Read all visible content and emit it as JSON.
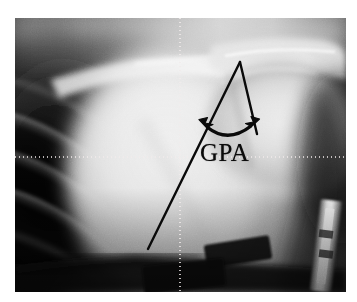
{
  "figure": {
    "kind": "radiograph",
    "modality": "shoulder-ap-xray",
    "background_color": "#ffffff"
  },
  "xray": {
    "name": "shoulder-radiograph",
    "frame": {
      "x": 15,
      "y": 18,
      "width": 331,
      "height": 274
    },
    "tone": {
      "darkest": "#050505",
      "dark": "#242424",
      "mid": "#8a8a8a",
      "light": "#d2d2d2",
      "brightest": "#fbfbfb"
    },
    "anatomy": [
      {
        "name": "clavicle",
        "label": "Clavicle"
      },
      {
        "name": "acromion",
        "label": "Acromion"
      },
      {
        "name": "humeral-head",
        "label": "Humeral head"
      },
      {
        "name": "glenoid",
        "label": "Glenoid"
      },
      {
        "name": "scapula-body",
        "label": "Scapula"
      },
      {
        "name": "rib-cage",
        "label": "Ribs"
      },
      {
        "name": "lung-field",
        "label": "Lung field"
      }
    ],
    "hardware": [
      {
        "name": "ecg-lead-left",
        "label": "ECG lead"
      },
      {
        "name": "ecg-lead-right",
        "label": "ECG lead"
      },
      {
        "name": "metal-marker",
        "label": "Radiopaque marker"
      }
    ]
  },
  "annotation": {
    "label": "GPA",
    "expansion": "Glenopolar angle",
    "color": "#0a0a0a",
    "line_width": 2.4,
    "label_position": {
      "x": 200,
      "y": 140
    },
    "label_font_size": 25,
    "arc_arrow": {
      "name": "double-headed-curved-arrow",
      "color": "#0a0a0a",
      "left_head_direction": "up-left",
      "right_head_direction": "up-right"
    },
    "angle_lines": [
      {
        "name": "glenoid-axis-line",
        "from": {
          "x": 240,
          "y": 62
        },
        "to": {
          "x": 148,
          "y": 249
        }
      },
      {
        "name": "scapular-body-line",
        "from": {
          "x": 240,
          "y": 62
        },
        "to": {
          "x": 257,
          "y": 134
        }
      }
    ],
    "vertex": {
      "x": 240,
      "y": 62
    }
  },
  "crosshair": {
    "name": "measurement-crosshair",
    "color": "#f2ecec",
    "horizontal_y": 157,
    "vertical_x": 180,
    "dash": "1 3"
  }
}
